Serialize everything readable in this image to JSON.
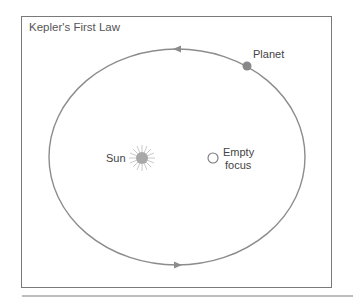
{
  "diagram": {
    "title": "Kepler's First Law",
    "labels": {
      "planet": "Planet",
      "sun": "Sun",
      "empty_focus_line1": "Empty",
      "empty_focus_line2": "focus"
    },
    "orbit": {
      "cx": 177,
      "cy": 157,
      "rx": 128,
      "ry": 108,
      "color": "#8c8c8c"
    },
    "planet": {
      "x": 247,
      "y": 66,
      "r": 4.5,
      "color": "#888888"
    },
    "sun": {
      "x": 142,
      "y": 158,
      "color": "#a8a8a8"
    },
    "empty_focus": {
      "x": 213,
      "y": 158,
      "r": 5
    },
    "arrows": [
      {
        "x": 178,
        "y": 49,
        "direction": "left"
      },
      {
        "x": 178,
        "y": 265,
        "direction": "right"
      }
    ]
  }
}
